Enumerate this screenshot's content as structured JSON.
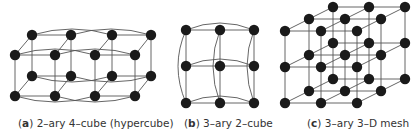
{
  "figures": [
    {
      "id": "a",
      "letter": "a",
      "caption": "2–ary 4–cube (hypercube)"
    },
    {
      "id": "b",
      "letter": "b",
      "caption": "3–ary 2–cube"
    },
    {
      "id": "c",
      "letter": "c",
      "caption": "3–ary 3–D mesh"
    }
  ],
  "colors": {
    "node": "#1a1a1a",
    "edge": "#555555",
    "caption": "#333333"
  }
}
